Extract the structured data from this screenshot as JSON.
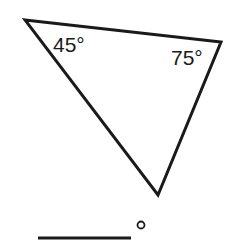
{
  "diagram": {
    "type": "triangle-angle-problem",
    "triangle": {
      "vertices": {
        "top_left": [
          25,
          20
        ],
        "top_right": [
          221,
          42
        ],
        "bottom": [
          158,
          195
        ]
      },
      "stroke_color": "#1a1a1a"
    },
    "angles": [
      {
        "vertex": "top_left",
        "label": "45°"
      },
      {
        "vertex": "top_right",
        "label": "75°"
      }
    ],
    "answer": {
      "blank": "",
      "unit_symbol": "°"
    }
  }
}
